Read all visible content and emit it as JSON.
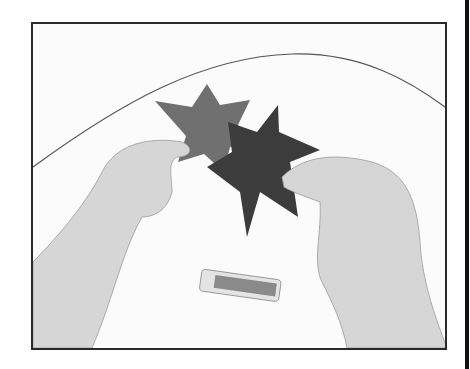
{
  "image": {
    "description": "Black-and-white photograph of two hands assembling two interlocking six-pointed paper stars above a table, with a glue stick lying below",
    "colors": {
      "frame": "#2a2a2a",
      "background": "#fbfbfb",
      "star_light": "#6e6e6e",
      "star_dark": "#3a3a3a",
      "skin": "#d8d8d8"
    }
  }
}
